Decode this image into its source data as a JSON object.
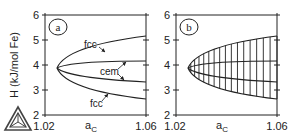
{
  "chart_data": [
    {
      "type": "line",
      "panel": "a",
      "title": "",
      "xlabel": "a_C",
      "ylabel": "H (kJ/mol Fe)",
      "xlim": [
        1.02,
        1.06
      ],
      "ylim": [
        2,
        6
      ],
      "x_ticks": [
        "1.02",
        "1.06"
      ],
      "y_ticks": [
        "2",
        "3",
        "4",
        "5",
        "6"
      ],
      "vertex": {
        "x": 1.0245,
        "y": 3.88
      },
      "series": [
        {
          "name": "fcc (upper)",
          "x": [
            1.0245,
            1.03,
            1.04,
            1.05,
            1.06
          ],
          "values": [
            3.88,
            4.35,
            4.72,
            4.95,
            5.15
          ]
        },
        {
          "name": "cem (upper)",
          "x": [
            1.0245,
            1.03,
            1.04,
            1.05,
            1.06
          ],
          "values": [
            3.88,
            3.98,
            4.06,
            4.11,
            4.15
          ]
        },
        {
          "name": "cem (lower)",
          "x": [
            1.0245,
            1.03,
            1.04,
            1.05,
            1.06
          ],
          "values": [
            3.88,
            3.68,
            3.5,
            3.38,
            3.3
          ]
        },
        {
          "name": "fcc (lower)",
          "x": [
            1.0245,
            1.03,
            1.04,
            1.05,
            1.06
          ],
          "values": [
            3.88,
            3.42,
            3.1,
            2.9,
            2.75
          ]
        }
      ],
      "annotations": [
        "fcc",
        "cem",
        "fcc"
      ],
      "panel_label": "a"
    },
    {
      "type": "line",
      "panel": "b",
      "title": "",
      "xlabel": "a_C",
      "ylabel": "",
      "xlim": [
        1.02,
        1.06
      ],
      "ylim": [
        2,
        6
      ],
      "x_ticks": [
        "1.02",
        "1.06"
      ],
      "y_ticks": [
        "2",
        "3",
        "4",
        "5",
        "6"
      ],
      "description": "Same four curves as panel a with vertical tie-lines spanning the region between outer fcc curves",
      "tie_line_count": 16,
      "panel_label": "b"
    }
  ],
  "labels": {
    "ylabel": "H (kJ/mol Fe)",
    "xlabel_main": "a",
    "xlabel_sub": "C",
    "fcc_upper": "fcc",
    "cem": "cem",
    "fcc_lower": "fcc",
    "panel_a": "a",
    "panel_b": "b",
    "yticks": [
      "6",
      "5",
      "4",
      "3",
      "2"
    ],
    "xtick_left": "1.02",
    "xtick_right": "1.06"
  },
  "logo": {
    "icon": "thermo-calc-triangle-logo"
  }
}
